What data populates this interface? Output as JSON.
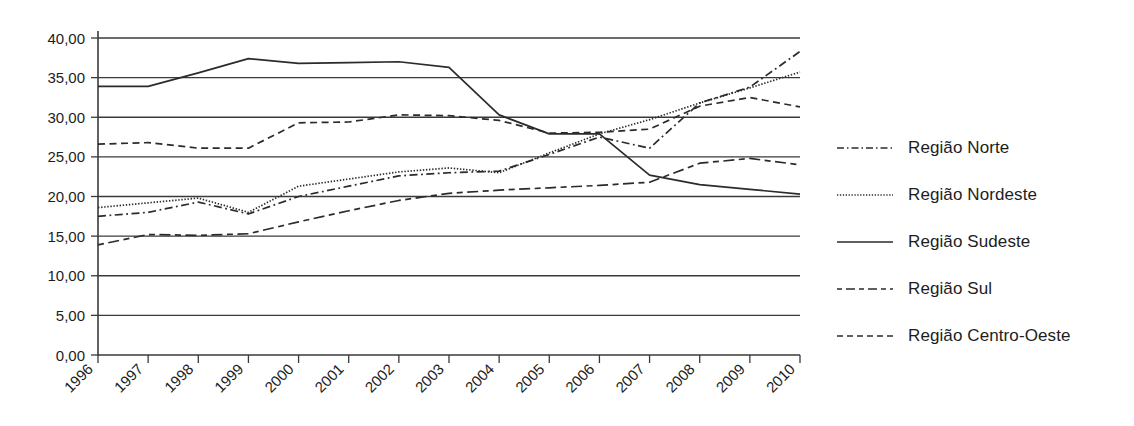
{
  "chart_data": {
    "type": "line",
    "title": "",
    "xlabel": "",
    "ylabel": "",
    "grid": true,
    "legend_position": "right",
    "ylim": [
      0,
      40
    ],
    "yticks": [
      "0,00",
      "5,00",
      "10,00",
      "15,00",
      "20,00",
      "25,00",
      "30,00",
      "35,00",
      "40,00"
    ],
    "ytick_values": [
      0,
      5,
      10,
      15,
      20,
      25,
      30,
      35,
      40
    ],
    "categories": [
      "1996",
      "1997",
      "1998",
      "1999",
      "2000",
      "2001",
      "2002",
      "2003",
      "2004",
      "2005",
      "2006",
      "2007",
      "2008",
      "2009",
      "2010"
    ],
    "series": [
      {
        "name": "Região Norte",
        "style": "dashdot",
        "color": "#2b2b2b",
        "values": [
          17.5,
          18.0,
          19.3,
          17.8,
          20.0,
          21.3,
          22.6,
          23.0,
          23.2,
          25.3,
          27.5,
          26.1,
          31.8,
          33.8,
          38.3
        ]
      },
      {
        "name": "Região Nordeste",
        "style": "dotted",
        "color": "#2b2b2b",
        "values": [
          18.6,
          19.2,
          19.8,
          18.0,
          21.3,
          22.2,
          23.1,
          23.6,
          23.0,
          25.5,
          27.9,
          29.7,
          31.8,
          33.7,
          35.7
        ]
      },
      {
        "name": "Região Sudeste",
        "style": "solid",
        "color": "#2b2b2b",
        "values": [
          33.9,
          33.9,
          35.6,
          37.4,
          36.8,
          36.9,
          37.0,
          36.3,
          30.3,
          27.9,
          27.9,
          22.7,
          21.5,
          20.9,
          20.3
        ]
      },
      {
        "name": "Região Sul",
        "style": "longdash",
        "color": "#2b2b2b",
        "values": [
          13.9,
          15.2,
          15.1,
          15.3,
          16.8,
          18.2,
          19.5,
          20.4,
          20.8,
          21.1,
          21.4,
          21.8,
          24.2,
          24.8,
          24.0
        ]
      },
      {
        "name": "Região Centro-Oeste",
        "style": "dashed",
        "color": "#2b2b2b",
        "values": [
          26.6,
          26.8,
          26.1,
          26.1,
          29.3,
          29.4,
          30.3,
          30.2,
          29.6,
          28.0,
          28.1,
          28.5,
          31.4,
          32.5,
          31.3
        ]
      }
    ]
  },
  "legend": {
    "items": [
      {
        "label": "Região Norte"
      },
      {
        "label": "Região Nordeste"
      },
      {
        "label": "Região Sudeste"
      },
      {
        "label": "Região Sul"
      },
      {
        "label": "Região Centro-Oeste"
      }
    ]
  }
}
